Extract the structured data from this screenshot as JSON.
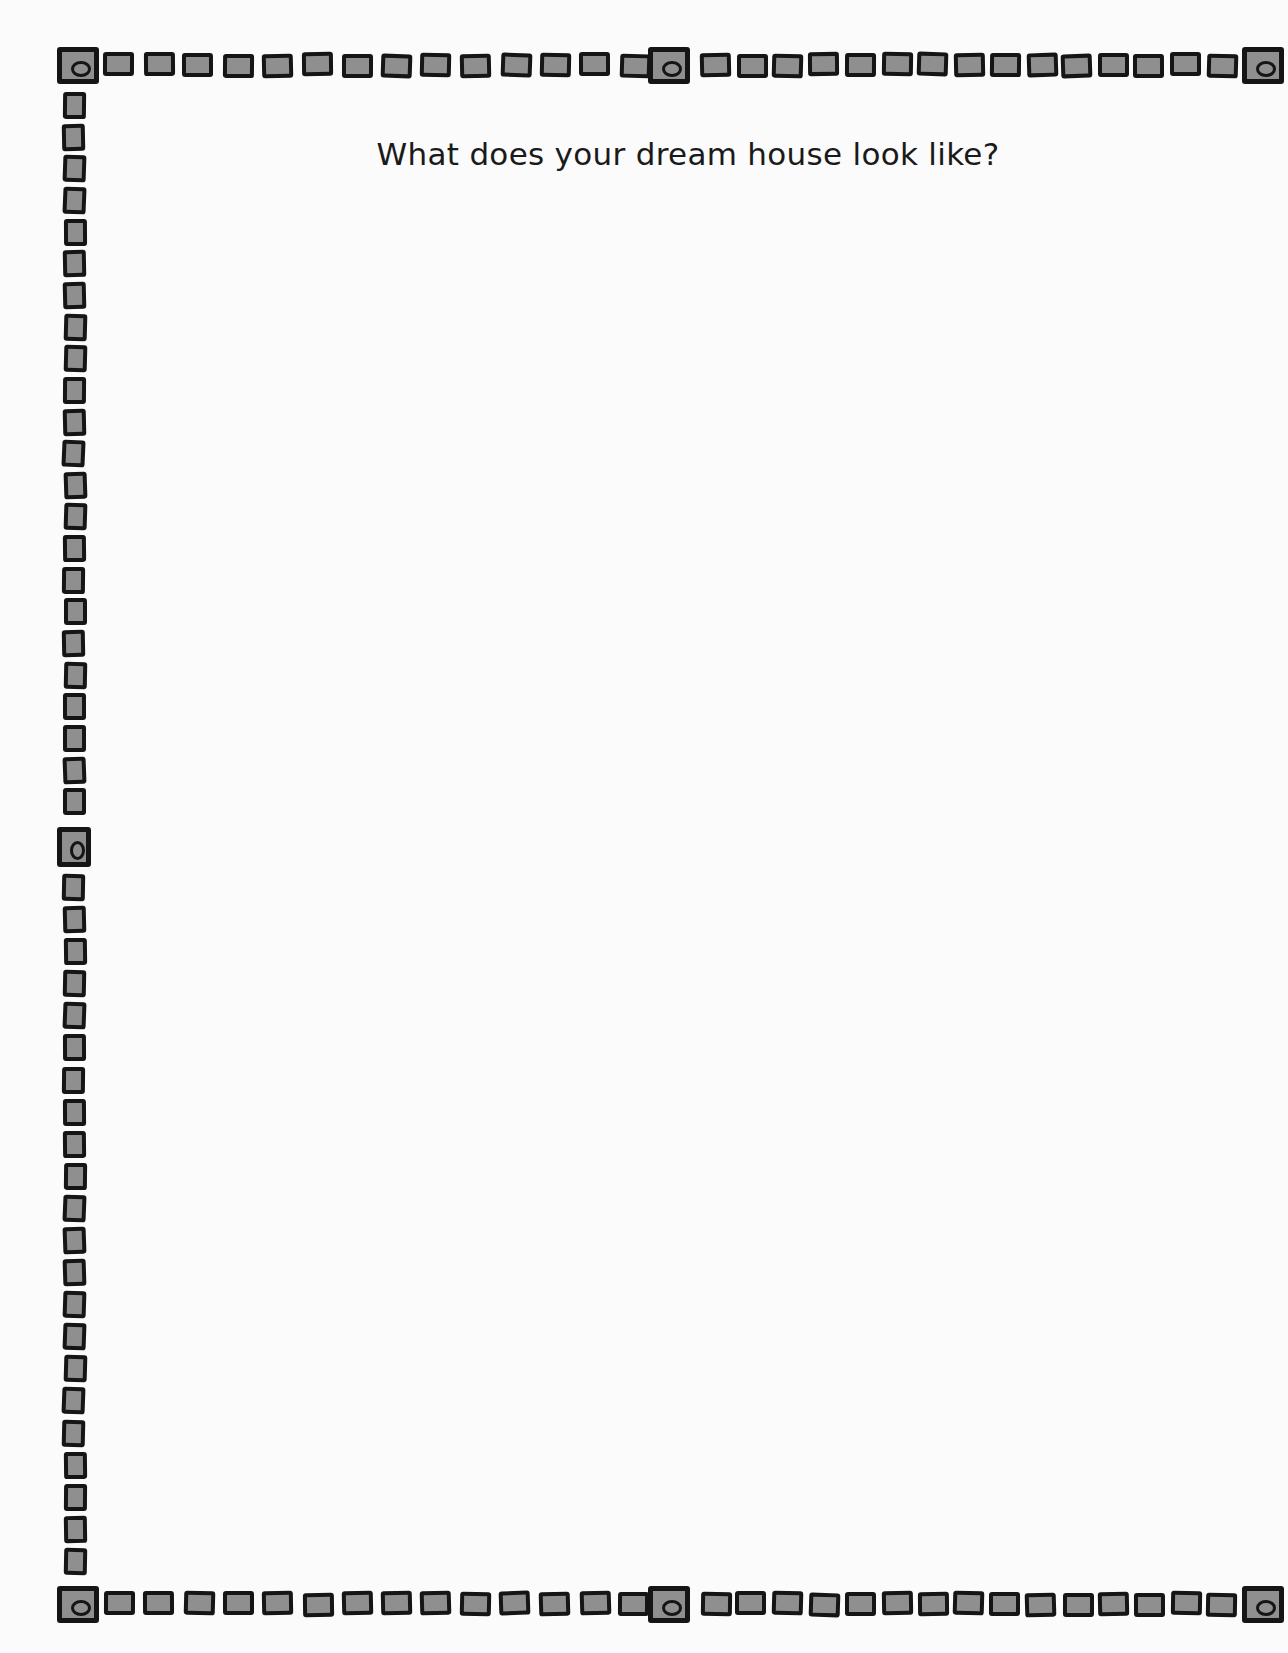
{
  "page": {
    "title": "What does your dream house look like?",
    "background_color": "#fbfbfb",
    "border": {
      "style": "hand-drawn square chain",
      "square_fill_color": "#8f8f8f",
      "square_outline_color": "#151515",
      "top_row": {
        "left_squares": 14,
        "right_squares": 15
      },
      "bottom_row": {
        "left_squares": 14,
        "right_squares": 15
      },
      "left_column": {
        "upper_squares": 23,
        "lower_squares": 22
      },
      "medallions": [
        "top-left",
        "top-center",
        "top-right",
        "left-middle",
        "bottom-left",
        "bottom-center",
        "bottom-right"
      ]
    },
    "drawing_area": {
      "content": ""
    }
  }
}
